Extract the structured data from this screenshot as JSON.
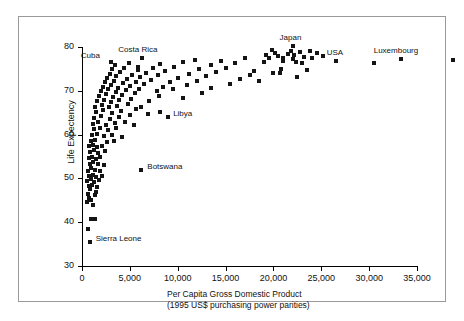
{
  "chart_data": {
    "type": "scatter",
    "title": "",
    "xlabel": "Per Capita Gross Domestic Product",
    "xlabel_line2": "(1995 US$ purchasing power parities)",
    "ylabel": "Life Expectency",
    "xlim": [
      0,
      40000
    ],
    "ylim": [
      30,
      80
    ],
    "xticks": [
      0,
      5000,
      10000,
      15000,
      20000,
      25000,
      30000,
      35000
    ],
    "xticklabels": [
      "0",
      "5,000",
      "10,000",
      "15,000",
      "20,000",
      "25,000",
      "30,000",
      "35,000"
    ],
    "yticks": [
      30,
      40,
      50,
      60,
      70,
      80
    ],
    "yticklabels": [
      "30",
      "40",
      "50",
      "60",
      "70",
      "80"
    ],
    "grid": false,
    "legend": null,
    "marker": "square",
    "marker_color": "#141414",
    "marker_size_px": 4,
    "annotations": [
      {
        "label": "Cuba",
        "x": 3000,
        "y": 76.5,
        "dx": -30,
        "dy": -7
      },
      {
        "label": "Costa Rica",
        "x": 6300,
        "y": 77.5,
        "dx": -24,
        "dy": -9
      },
      {
        "label": "Japan",
        "x": 22000,
        "y": 80.2,
        "dx": -13,
        "dy": -9
      },
      {
        "label": "USA",
        "x": 26500,
        "y": 76.9,
        "dx": -9,
        "dy": -9
      },
      {
        "label": "Luxembourg",
        "x": 33300,
        "y": 77.2,
        "dx": -27,
        "dy": -9
      },
      {
        "label": "Libya",
        "x": 9000,
        "y": 64.0,
        "dx": 5,
        "dy": -4
      },
      {
        "label": "Botswana",
        "x": 6200,
        "y": 52.0,
        "dx": 6,
        "dy": -4
      },
      {
        "label": "Sierra Leone",
        "x": 800,
        "y": 35.5,
        "dx": 6,
        "dy": -4
      }
    ],
    "points": [
      [
        670,
        38.5
      ],
      [
        900,
        40.7
      ],
      [
        1350,
        40.8
      ],
      [
        800,
        35.5
      ],
      [
        560,
        44.5
      ],
      [
        720,
        45.5
      ],
      [
        980,
        45.0
      ],
      [
        1150,
        44.0
      ],
      [
        640,
        46.5
      ],
      [
        1320,
        46.2
      ],
      [
        880,
        47.5
      ],
      [
        1480,
        47.0
      ],
      [
        700,
        48.3
      ],
      [
        1050,
        48.6
      ],
      [
        1600,
        48.0
      ],
      [
        560,
        49.5
      ],
      [
        920,
        49.8
      ],
      [
        1280,
        49.2
      ],
      [
        1750,
        49.6
      ],
      [
        760,
        50.5
      ],
      [
        1100,
        50.8
      ],
      [
        1500,
        50.3
      ],
      [
        2050,
        50.6
      ],
      [
        6200,
        52.0
      ],
      [
        640,
        51.8
      ],
      [
        980,
        52.3
      ],
      [
        1380,
        52.0
      ],
      [
        1850,
        51.6
      ],
      [
        820,
        53.4
      ],
      [
        1200,
        53.8
      ],
      [
        1620,
        53.2
      ],
      [
        2250,
        53.0
      ],
      [
        700,
        54.6
      ],
      [
        1050,
        54.9
      ],
      [
        1450,
        54.4
      ],
      [
        1900,
        54.8
      ],
      [
        880,
        56.0
      ],
      [
        1300,
        56.4
      ],
      [
        1700,
        55.8
      ],
      [
        2400,
        56.2
      ],
      [
        760,
        57.3
      ],
      [
        1150,
        57.6
      ],
      [
        1550,
        57.1
      ],
      [
        2100,
        57.4
      ],
      [
        900,
        58.5
      ],
      [
        1400,
        58.8
      ],
      [
        2600,
        58.3
      ],
      [
        3300,
        58.6
      ],
      [
        1020,
        59.8
      ],
      [
        1600,
        60.2
      ],
      [
        2300,
        59.6
      ],
      [
        3100,
        60.0
      ],
      [
        4200,
        59.4
      ],
      [
        1250,
        61.2
      ],
      [
        1850,
        61.6
      ],
      [
        2700,
        61.0
      ],
      [
        3600,
        61.4
      ],
      [
        1100,
        62.4
      ],
      [
        1700,
        62.8
      ],
      [
        2500,
        62.2
      ],
      [
        3400,
        62.6
      ],
      [
        4500,
        62.9
      ],
      [
        5400,
        62.3
      ],
      [
        1300,
        63.8
      ],
      [
        2000,
        64.2
      ],
      [
        2900,
        63.6
      ],
      [
        3900,
        64.0
      ],
      [
        5000,
        64.4
      ],
      [
        6900,
        64.6
      ],
      [
        1500,
        65.2
      ],
      [
        2200,
        65.6
      ],
      [
        3100,
        65.0
      ],
      [
        4100,
        65.4
      ],
      [
        5600,
        65.8
      ],
      [
        8200,
        65.2
      ],
      [
        1400,
        66.4
      ],
      [
        2100,
        66.8
      ],
      [
        2800,
        66.2
      ],
      [
        3700,
        66.6
      ],
      [
        4800,
        67.0
      ],
      [
        6200,
        66.4
      ],
      [
        1600,
        67.6
      ],
      [
        2300,
        68.0
      ],
      [
        3000,
        67.4
      ],
      [
        3900,
        67.8
      ],
      [
        5100,
        68.2
      ],
      [
        7000,
        67.6
      ],
      [
        1800,
        68.8
      ],
      [
        2500,
        69.2
      ],
      [
        3200,
        68.6
      ],
      [
        4200,
        69.0
      ],
      [
        5500,
        69.4
      ],
      [
        8000,
        68.8
      ],
      [
        10500,
        68.4
      ],
      [
        1950,
        69.9
      ],
      [
        2700,
        70.3
      ],
      [
        3500,
        69.7
      ],
      [
        4600,
        70.1
      ],
      [
        6000,
        70.5
      ],
      [
        7800,
        69.9
      ],
      [
        9500,
        70.3
      ],
      [
        12500,
        69.6
      ],
      [
        2200,
        70.9
      ],
      [
        3000,
        71.3
      ],
      [
        3800,
        70.7
      ],
      [
        5000,
        71.1
      ],
      [
        6500,
        71.5
      ],
      [
        8500,
        70.9
      ],
      [
        11000,
        71.3
      ],
      [
        13500,
        70.6
      ],
      [
        2400,
        71.9
      ],
      [
        3300,
        72.3
      ],
      [
        4300,
        71.7
      ],
      [
        5600,
        72.1
      ],
      [
        7200,
        72.5
      ],
      [
        9200,
        71.9
      ],
      [
        12000,
        72.3
      ],
      [
        15500,
        71.6
      ],
      [
        2600,
        72.9
      ],
      [
        3600,
        73.3
      ],
      [
        4700,
        72.7
      ],
      [
        6100,
        73.1
      ],
      [
        7900,
        73.5
      ],
      [
        10000,
        72.9
      ],
      [
        13000,
        73.3
      ],
      [
        16500,
        72.6
      ],
      [
        18500,
        72.2
      ],
      [
        2900,
        73.9
      ],
      [
        4000,
        74.3
      ],
      [
        5200,
        73.7
      ],
      [
        6700,
        74.1
      ],
      [
        8700,
        74.5
      ],
      [
        11200,
        73.9
      ],
      [
        14000,
        74.3
      ],
      [
        17500,
        73.6
      ],
      [
        20000,
        74.0
      ],
      [
        22500,
        73.2
      ],
      [
        3100,
        74.9
      ],
      [
        4400,
        75.3
      ],
      [
        5800,
        74.7
      ],
      [
        7400,
        75.1
      ],
      [
        9600,
        75.5
      ],
      [
        12200,
        74.9
      ],
      [
        15000,
        75.3
      ],
      [
        18000,
        74.6
      ],
      [
        20800,
        75.0
      ],
      [
        23500,
        74.8
      ],
      [
        3000,
        76.5
      ],
      [
        3400,
        75.9
      ],
      [
        4900,
        76.3
      ],
      [
        6300,
        77.5
      ],
      [
        8200,
        76.1
      ],
      [
        10500,
        76.5
      ],
      [
        13500,
        75.9
      ],
      [
        16000,
        76.3
      ],
      [
        19000,
        76.6
      ],
      [
        21000,
        76.8
      ],
      [
        22000,
        77.2
      ],
      [
        23000,
        76.4
      ],
      [
        26500,
        76.9
      ],
      [
        30500,
        76.4
      ],
      [
        33300,
        77.2
      ],
      [
        5800,
        75.5
      ],
      [
        11800,
        77.0
      ],
      [
        14500,
        76.8
      ],
      [
        17000,
        77.4
      ],
      [
        19500,
        77.6
      ],
      [
        20500,
        78.0
      ],
      [
        21500,
        78.4
      ],
      [
        22200,
        78.2
      ],
      [
        23200,
        77.8
      ],
      [
        24000,
        77.4
      ],
      [
        21800,
        79.0
      ],
      [
        22800,
        78.8
      ],
      [
        20200,
        78.6
      ],
      [
        19200,
        78.2
      ],
      [
        24500,
        78.6
      ],
      [
        25200,
        77.9
      ],
      [
        21000,
        77.4
      ],
      [
        22400,
        76.6
      ],
      [
        23800,
        79.2
      ],
      [
        19800,
        79.4
      ],
      [
        38800,
        77.0
      ],
      [
        20700,
        74.0
      ]
    ]
  }
}
